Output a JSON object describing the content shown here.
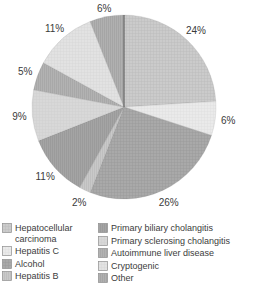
{
  "chart_data": {
    "type": "pie",
    "title": "",
    "start_angle_deg": 0,
    "direction": "clockwise",
    "labels_show_pct": true,
    "slices": [
      {
        "label": "Hepatocellular carcinoma",
        "pct": 24,
        "display": "24%",
        "fill": "#cbcbcb",
        "texture": "grid",
        "texture_color": "#bcbcbc"
      },
      {
        "label": "Hepatitis C",
        "pct": 6,
        "display": "6%",
        "fill": "#eaeaea",
        "texture": "grid",
        "texture_color": "#e0e0e0"
      },
      {
        "label": "Alcohol",
        "pct": 26,
        "display": "26%",
        "fill": "#a9a9a9",
        "texture": "grid",
        "texture_color": "#9b9b9b"
      },
      {
        "label": "Hepatitis B",
        "pct": 2,
        "display": "2%",
        "fill": "#c9c9c9",
        "texture": "vlines",
        "texture_color": "#b8b8b8"
      },
      {
        "label": "Primary biliary cholangitis",
        "pct": 11,
        "display": "11%",
        "fill": "#a4a4a4",
        "texture": "vlines",
        "texture_color": "#959595"
      },
      {
        "label": "Primary sclerosing cholangitis",
        "pct": 9,
        "display": "9%",
        "fill": "#d8d8d8",
        "texture": "grid",
        "texture_color": "#cecece"
      },
      {
        "label": "Autoimmune liver disease",
        "pct": 5,
        "display": "5%",
        "fill": "#b2b2b2",
        "texture": "vlines",
        "texture_color": "#a1a1a1"
      },
      {
        "label": "Cryptogenic",
        "pct": 11,
        "display": "11%",
        "fill": "#e2e2e2",
        "texture": "grid",
        "texture_color": "#d8d8d8"
      },
      {
        "label": "Other",
        "pct": 6,
        "display": "6%",
        "fill": "#b0b0b0",
        "texture": "vlines",
        "texture_color": "#9e9e9e"
      }
    ],
    "legend": {
      "position": "bottom",
      "columns": [
        [
          0,
          1,
          2,
          3
        ],
        [
          4,
          5,
          6,
          7,
          8
        ]
      ]
    }
  },
  "styles": {
    "background": "#ffffff",
    "label_color": "#3a3a3a",
    "legend_text_color": "#3c3c3c",
    "divider_line_color": "#555555",
    "swatch_border_color": "#8f8f8f"
  }
}
